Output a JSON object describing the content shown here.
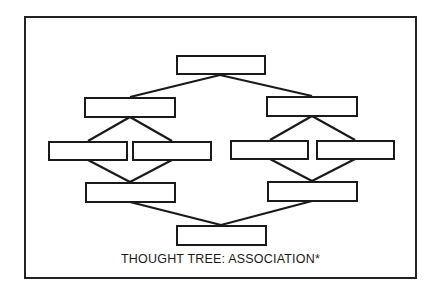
{
  "diagram": {
    "caption": "THOUGHT TREE:  ASSOCIATION*",
    "line_color": "#1a1a1a",
    "nodes": [
      {
        "id": "top",
        "label": ""
      },
      {
        "id": "l2-left",
        "label": ""
      },
      {
        "id": "l2-right",
        "label": ""
      },
      {
        "id": "l3-left-a",
        "label": ""
      },
      {
        "id": "l3-left-b",
        "label": ""
      },
      {
        "id": "l3-right-a",
        "label": ""
      },
      {
        "id": "l3-right-b",
        "label": ""
      },
      {
        "id": "l4-left",
        "label": ""
      },
      {
        "id": "l4-right",
        "label": ""
      },
      {
        "id": "bottom",
        "label": ""
      }
    ],
    "edges": [
      [
        "top",
        "l2-left"
      ],
      [
        "top",
        "l2-right"
      ],
      [
        "l2-left",
        "l3-left-a"
      ],
      [
        "l2-left",
        "l3-left-b"
      ],
      [
        "l2-right",
        "l3-right-a"
      ],
      [
        "l2-right",
        "l3-right-b"
      ],
      [
        "l3-left-a",
        "l4-left"
      ],
      [
        "l3-left-b",
        "l4-left"
      ],
      [
        "l3-right-a",
        "l4-right"
      ],
      [
        "l3-right-b",
        "l4-right"
      ],
      [
        "l4-left",
        "bottom"
      ],
      [
        "l4-right",
        "bottom"
      ]
    ]
  }
}
